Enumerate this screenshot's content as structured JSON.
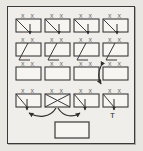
{
  "diagram": {
    "frame": {
      "label": "outer-frame",
      "x": 7,
      "y": 6,
      "width": 128,
      "height": 138,
      "border_color": "#3a3a3a",
      "fill_color": "#efeeea"
    },
    "background_color": "#e9e7e2",
    "ink_color": "#3a3a3a",
    "mark_color": "#6f6f6f",
    "grid": {
      "rows": 4,
      "columns": 4,
      "cell_width": 25,
      "cell_height": 13,
      "col_x": [
        16,
        45,
        74,
        103
      ],
      "row_y": [
        19,
        43,
        67,
        94
      ]
    },
    "cells": [
      {
        "id": "r1c1",
        "row": 1,
        "col": 1,
        "x": 16,
        "y": 19,
        "marks": "x x",
        "glyph": "diagonal-down-right-arrow",
        "label": ""
      },
      {
        "id": "r1c2",
        "row": 1,
        "col": 2,
        "x": 45,
        "y": 19,
        "marks": "x x",
        "glyph": "diagonal-down-right-arrow",
        "label": ""
      },
      {
        "id": "r1c3",
        "row": 1,
        "col": 3,
        "x": 74,
        "y": 19,
        "marks": "x x",
        "glyph": "diagonal-down-right-arrow",
        "label": ""
      },
      {
        "id": "r1c4",
        "row": 1,
        "col": 4,
        "x": 103,
        "y": 19,
        "marks": "x x",
        "glyph": "diagonal-down-right-arrow",
        "label": ""
      },
      {
        "id": "r2c1",
        "row": 2,
        "col": 1,
        "x": 16,
        "y": 43,
        "marks": "x x",
        "glyph": "diagonal-down-left",
        "label": ""
      },
      {
        "id": "r2c2",
        "row": 2,
        "col": 2,
        "x": 45,
        "y": 43,
        "marks": "x x",
        "glyph": "diagonal-down-left",
        "label": ""
      },
      {
        "id": "r2c3",
        "row": 2,
        "col": 3,
        "x": 74,
        "y": 43,
        "marks": "x x",
        "glyph": "diagonal-down-left",
        "label": ""
      },
      {
        "id": "r2c4",
        "row": 2,
        "col": 4,
        "x": 103,
        "y": 43,
        "marks": "x x",
        "glyph": "diagonal-down-left",
        "label": ""
      },
      {
        "id": "r3c1",
        "row": 3,
        "col": 1,
        "x": 16,
        "y": 67,
        "marks": "x x",
        "glyph": "empty",
        "label": ""
      },
      {
        "id": "r3c2",
        "row": 3,
        "col": 2,
        "x": 45,
        "y": 67,
        "marks": "x x",
        "glyph": "empty",
        "label": ""
      },
      {
        "id": "r3c3",
        "row": 3,
        "col": 3,
        "x": 74,
        "y": 67,
        "marks": "x x",
        "glyph": "empty",
        "label": ""
      },
      {
        "id": "r3c4",
        "row": 3,
        "col": 4,
        "x": 103,
        "y": 67,
        "marks": "x x",
        "glyph": "empty",
        "label": ""
      },
      {
        "id": "r4c1",
        "row": 4,
        "col": 1,
        "x": 16,
        "y": 94,
        "marks": "x x",
        "glyph": "diagonal-down-arrow",
        "label": ""
      },
      {
        "id": "r4c2",
        "row": 4,
        "col": 2,
        "x": 45,
        "y": 94,
        "marks": "x x",
        "glyph": "cross",
        "label": ""
      },
      {
        "id": "r4c3",
        "row": 4,
        "col": 3,
        "x": 74,
        "y": 94,
        "marks": "x x",
        "glyph": "diagonal-down-arrow",
        "label": ""
      },
      {
        "id": "r4c4",
        "row": 4,
        "col": 4,
        "x": 103,
        "y": 94,
        "marks": "x x",
        "glyph": "diagonal-down-arrow",
        "label": ""
      }
    ],
    "marks_text": "x x",
    "annotations": [
      {
        "id": "t-label",
        "text": "T",
        "x": 110,
        "y": 114,
        "name": "label-T"
      }
    ],
    "connectors": [
      {
        "id": "vertical-double-arrow",
        "type": "double-headed-vertical",
        "x": 101,
        "y_from": 65,
        "y_to": 83,
        "name": "swap-arrow-vertical"
      },
      {
        "id": "curve-left",
        "type": "curved-arrow",
        "from": "r4c2",
        "to_x": 28,
        "to_y": 113,
        "name": "crossover-arrow-left"
      },
      {
        "id": "curve-right",
        "type": "curved-arrow",
        "from": "r4c2",
        "to_x": 78,
        "to_y": 112,
        "name": "crossover-arrow-right"
      }
    ],
    "bottom_box": {
      "id": "result-box",
      "x": 55,
      "y": 122,
      "width": 34,
      "height": 16,
      "text": "",
      "name": "bottom-result-box"
    }
  }
}
